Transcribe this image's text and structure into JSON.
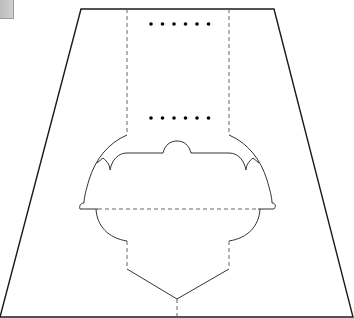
{
  "diagram": {
    "kind": "cut-and-fold template",
    "colors": {
      "background": "#ffffff",
      "cut_line": "#1a1a1a",
      "fold_line": "#555555",
      "dots": "#000000",
      "swatch": "#c4c4c4"
    },
    "outline": {
      "type": "trapezoid",
      "points": [
        [
          81,
          9
        ],
        [
          274,
          9
        ],
        [
          353,
          317
        ],
        [
          0,
          317
        ]
      ]
    },
    "fold_lines_vertical": [
      {
        "x": 127,
        "y1": 9,
        "y2": 135
      },
      {
        "x": 229,
        "y1": 9,
        "y2": 135
      },
      {
        "x": 127,
        "y1": 241,
        "y2": 269
      },
      {
        "x": 229,
        "y1": 241,
        "y2": 269
      },
      {
        "x": 177,
        "y1": 299,
        "y2": 317
      }
    ],
    "fold_line_horizontal": {
      "y": 209,
      "x1": 98,
      "x2": 258
    },
    "dot_rows": [
      {
        "y": 24,
        "xs": [
          151,
          162,
          174,
          185,
          197,
          208
        ]
      },
      {
        "y": 118,
        "xs": [
          151,
          162,
          174,
          185,
          197,
          208
        ]
      }
    ],
    "v_cut": {
      "left": [
        127,
        269
      ],
      "apex": [
        177,
        299
      ],
      "right": [
        229,
        269
      ]
    }
  }
}
